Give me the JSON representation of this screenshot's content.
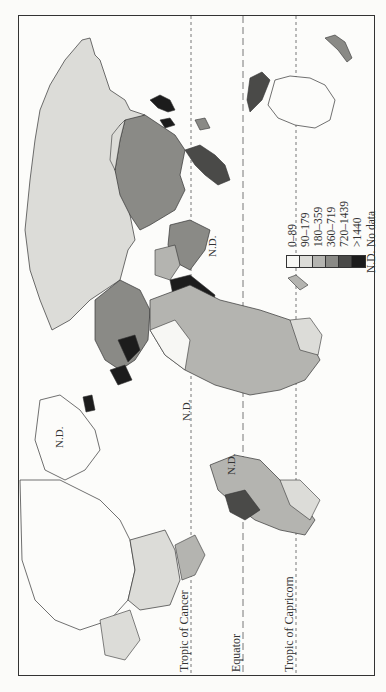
{
  "map": {
    "orientation": "rotated 90 degrees counter-clockwise",
    "reference_lines": [
      {
        "name": "Tropic of Cancer",
        "label": "Tropic of Cancer"
      },
      {
        "name": "Equator",
        "label": "Equator"
      },
      {
        "name": "Tropic of Capricorn",
        "label": "Tropic of Capricorn"
      }
    ],
    "nd_labels": [
      "N.D.",
      "N.D.",
      "N.D.",
      "N.D."
    ]
  },
  "legend": {
    "items": [
      {
        "label": "0–89",
        "color": "#f7f7f4"
      },
      {
        "label": "90–179",
        "color": "#dcdcd8"
      },
      {
        "label": "180–359",
        "color": "#b4b4b0"
      },
      {
        "label": "360–719",
        "color": "#8a8a86"
      },
      {
        "label": "720–1439",
        "color": "#4a4a48"
      },
      {
        "label": ">1440",
        "color": "#1c1c1c"
      }
    ],
    "no_data": {
      "code": "N.D.",
      "label": "No data"
    }
  }
}
